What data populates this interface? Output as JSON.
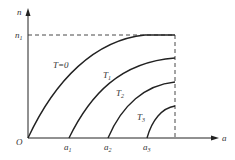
{
  "figure": {
    "axes": {
      "y_label": "n",
      "x_label": "a",
      "origin_label": "O",
      "y_marker": {
        "base": "n",
        "sub": "1"
      }
    },
    "x_ticks": [
      {
        "base": "a",
        "sub": "1"
      },
      {
        "base": "a",
        "sub": "2"
      },
      {
        "base": "a",
        "sub": "3"
      }
    ],
    "curves": [
      {
        "label": "T=0",
        "sub": ""
      },
      {
        "label": "T",
        "sub": "1"
      },
      {
        "label": "T",
        "sub": "2"
      },
      {
        "label": "T",
        "sub": "3"
      }
    ],
    "colors": {
      "line": "#222222",
      "text": "#333333"
    }
  }
}
